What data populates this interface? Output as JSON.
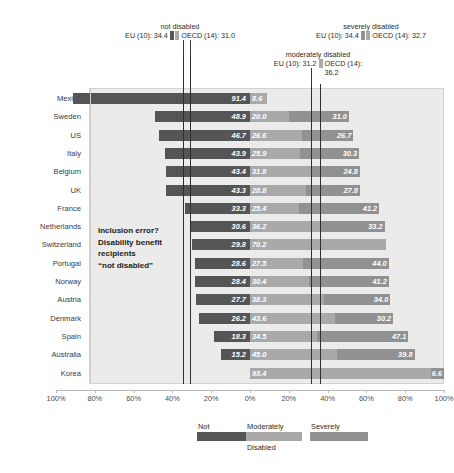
{
  "chart_data": {
    "type": "bar",
    "subtype": "diverging-stacked-horizontal",
    "title": "",
    "xlabel": "",
    "ylabel": "",
    "grid": false,
    "legend_position": "bottom",
    "xlim": [
      -100,
      100
    ],
    "x_ticks": [
      "100%",
      "80%",
      "60%",
      "40%",
      "20%",
      "0%",
      "20%",
      "40%",
      "60%",
      "80%",
      "100%"
    ],
    "x_tick_values": [
      -100,
      -80,
      -60,
      -40,
      -20,
      0,
      20,
      40,
      60,
      80,
      100
    ],
    "categories": [
      "Mexico",
      "Sweden",
      "US",
      "Italy",
      "Belgium",
      "UK",
      "France",
      "Netherlands",
      "Switzerland",
      "Portugal",
      "Norway",
      "Austria",
      "Denmark",
      "Spain",
      "Australia",
      "Korea"
    ],
    "series": [
      {
        "name": "Not",
        "full_name": "not disabled",
        "color": "#555555",
        "direction": "left",
        "values": [
          91.4,
          48.9,
          46.7,
          43.9,
          43.4,
          43.3,
          33.3,
          30.6,
          29.8,
          28.6,
          28.4,
          27.7,
          26.2,
          18.3,
          15.2,
          null
        ]
      },
      {
        "name": "Moderately",
        "full_name": "moderately disabled",
        "color": "#a9a9a9",
        "direction": "right",
        "values": [
          8.6,
          20.0,
          26.6,
          25.9,
          31.8,
          28.8,
          25.4,
          36.2,
          70.2,
          27.5,
          30.4,
          38.3,
          43.6,
          34.5,
          45.0,
          93.4
        ]
      },
      {
        "name": "Severely",
        "full_name": "severely disabled",
        "color": "#919191",
        "direction": "right",
        "values": [
          null,
          31.0,
          26.7,
          30.3,
          24.8,
          27.8,
          41.2,
          33.2,
          null,
          44.0,
          41.2,
          34.0,
          30.2,
          47.1,
          39.8,
          6.6
        ]
      }
    ],
    "annotations": [
      {
        "id": "not-disabled",
        "title": "not disabled",
        "eu_label": "EU (10): 34.4",
        "eu_value": 34.4,
        "oecd_label": "OECD (14): 31.0",
        "oecd_value": 31.0,
        "side": "left"
      },
      {
        "id": "moderately-disabled",
        "title": "moderately disabled",
        "eu_label": "EU (10): 31.2",
        "eu_value": 31.2,
        "oecd_label": "OECD (14):",
        "oecd_label_cont": "36.2",
        "oecd_value": 36.2,
        "side": "right"
      },
      {
        "id": "severely-disabled",
        "title": "severely disabled",
        "eu_label": "EU (10): 34.4",
        "eu_value": 34.4,
        "oecd_label": "OECD (14): 32.7",
        "oecd_value": 32.7,
        "side": "right"
      }
    ],
    "note_lines": [
      "Inclusion error?",
      "Disability benefit",
      "recipients",
      "“not disabled”"
    ],
    "legend": {
      "items": [
        {
          "label": "Not",
          "color": "#555555"
        },
        {
          "label": "Moderately",
          "color": "#a9a9a9"
        },
        {
          "label": "Severely",
          "color": "#919191"
        }
      ],
      "footer": "Disabled"
    },
    "colors": {
      "not_disabled": "#555555",
      "moderately_disabled": "#a9a9a9",
      "severely_disabled": "#919191",
      "plot_background": "#ebebeb",
      "reference_line": "#2f2f2f"
    }
  }
}
